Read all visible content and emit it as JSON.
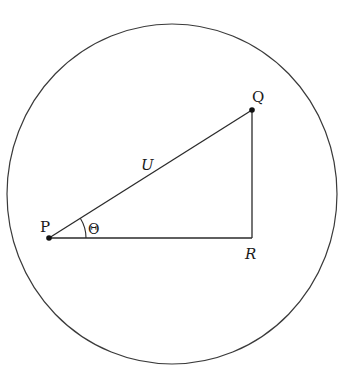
{
  "diagram": {
    "type": "geometry",
    "circle": {
      "cx": 172,
      "cy": 194,
      "rx": 165,
      "ry": 170,
      "stroke": "#3a3a3a"
    },
    "points": {
      "P": {
        "label": "P",
        "x": 49,
        "y": 238
      },
      "Q": {
        "label": "Q",
        "x": 252,
        "y": 110
      },
      "R": {
        "label": "R",
        "x": 252,
        "y": 238
      }
    },
    "edges": [
      {
        "from": "P",
        "to": "Q",
        "label": "U"
      },
      {
        "from": "Q",
        "to": "R",
        "label": ""
      },
      {
        "from": "P",
        "to": "R",
        "label": ""
      }
    ],
    "angle": {
      "vertex": "P",
      "label": "Θ"
    },
    "labels": {
      "p": "P",
      "q": "Q",
      "r": "R",
      "u": "U",
      "theta": "Θ"
    },
    "line_color": "#2a2a2a"
  }
}
